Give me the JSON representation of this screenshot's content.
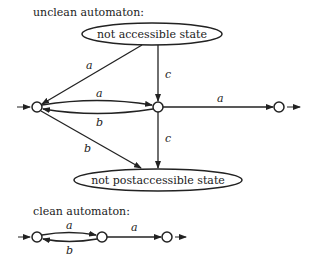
{
  "unclean": {
    "title": "unclean automaton:",
    "states": {
      "not_accessible": "not accessible state",
      "not_postaccessible": "not postaccessible state"
    },
    "edges": {
      "na_to_q0": "a",
      "na_to_q1": "c",
      "q0_to_q1": "a",
      "q1_to_q0": "b",
      "q1_to_q2": "a",
      "q0_to_np": "b",
      "q1_to_np": "c"
    }
  },
  "clean": {
    "title": "clean automaton:",
    "edges": {
      "q0_to_q1": "a",
      "q1_to_q0": "b",
      "q1_to_q2": "a"
    }
  },
  "colors": {
    "stroke": "#222222",
    "background": "#ffffff"
  }
}
